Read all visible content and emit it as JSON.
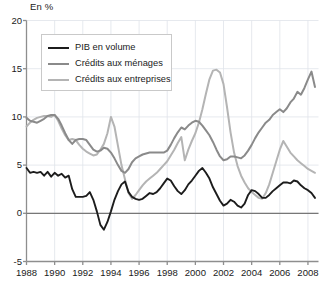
{
  "unit_label": "En %",
  "legend": {
    "items": [
      {
        "label": "PIB en volume",
        "color": "#1c1c1c"
      },
      {
        "label": "Crédits aux ménages",
        "color": "#8a8a8a"
      },
      {
        "label": "Crédits aux entreprises",
        "color": "#b4b4b4"
      }
    ]
  },
  "axis": {
    "y_ticks": [
      "20",
      "15",
      "10",
      "5",
      "0",
      "-5"
    ],
    "x_ticks": [
      "1988",
      "1990",
      "1992",
      "1994",
      "1996",
      "1998",
      "2000",
      "2002",
      "2004",
      "2006",
      "2008"
    ]
  },
  "chart_data": {
    "type": "line",
    "title": "",
    "xlabel": "",
    "ylabel": "En %",
    "xlim": [
      1988,
      2008.75
    ],
    "ylim": [
      -5,
      20
    ],
    "ytick_values": [
      20,
      15,
      10,
      5,
      0,
      -5
    ],
    "xtick_values": [
      1988,
      1990,
      1992,
      1994,
      1996,
      1998,
      2000,
      2002,
      2004,
      2006,
      2008
    ],
    "grid": true,
    "legend_position": "upper-left-inside",
    "zero_line": 0,
    "x": [
      1988,
      1988.25,
      1988.5,
      1988.75,
      1989,
      1989.25,
      1989.5,
      1989.75,
      1990,
      1990.25,
      1990.5,
      1990.75,
      1991,
      1991.25,
      1991.5,
      1991.75,
      1992,
      1992.25,
      1992.5,
      1992.75,
      1993,
      1993.25,
      1993.5,
      1993.75,
      1994,
      1994.25,
      1994.5,
      1994.75,
      1995,
      1995.25,
      1995.5,
      1995.75,
      1996,
      1996.25,
      1996.5,
      1996.75,
      1997,
      1997.25,
      1997.5,
      1997.75,
      1998,
      1998.25,
      1998.5,
      1998.75,
      1999,
      1999.25,
      1999.5,
      1999.75,
      2000,
      2000.25,
      2000.5,
      2000.75,
      2001,
      2001.25,
      2001.5,
      2001.75,
      2002,
      2002.25,
      2002.5,
      2002.75,
      2003,
      2003.25,
      2003.5,
      2003.75,
      2004,
      2004.25,
      2004.5,
      2004.75,
      2005,
      2005.25,
      2005.5,
      2005.75,
      2006,
      2006.25,
      2006.5,
      2006.75,
      2007,
      2007.25,
      2007.5,
      2007.75,
      2008,
      2008.25,
      2008.5
    ],
    "series": [
      {
        "name": "PIB en volume",
        "color": "#1c1c1c",
        "values": [
          4.7,
          4.2,
          4.3,
          4.2,
          4.3,
          3.9,
          4.3,
          3.8,
          4.2,
          3.9,
          4.1,
          3.7,
          3.9,
          2.5,
          1.7,
          1.7,
          1.7,
          1.8,
          2.2,
          1.4,
          0.2,
          -1.2,
          -1.7,
          -0.9,
          0.2,
          1.4,
          2.3,
          3.0,
          3.3,
          2.2,
          1.7,
          1.5,
          1.4,
          1.5,
          1.8,
          2.1,
          2.0,
          2.2,
          2.6,
          3.1,
          3.6,
          3.4,
          2.8,
          2.3,
          2.0,
          2.4,
          3.0,
          3.4,
          3.9,
          4.4,
          4.7,
          4.2,
          3.6,
          2.7,
          2.0,
          1.3,
          0.8,
          1.0,
          1.4,
          1.2,
          0.8,
          0.6,
          1.0,
          1.9,
          2.4,
          2.3,
          2.0,
          1.6,
          1.6,
          1.9,
          2.3,
          2.6,
          2.9,
          3.2,
          3.2,
          3.1,
          3.4,
          3.3,
          2.9,
          2.6,
          2.4,
          2.1,
          1.6
        ]
      },
      {
        "name": "Crédits aux ménages",
        "color": "#8a8a8a",
        "values": [
          9.9,
          9.6,
          9.5,
          9.4,
          9.6,
          9.8,
          10.1,
          10.2,
          10.2,
          9.8,
          9.1,
          8.3,
          7.6,
          7.2,
          7.6,
          7.7,
          7.7,
          7.6,
          7.1,
          6.6,
          6.4,
          6.5,
          6.8,
          6.7,
          6.3,
          5.7,
          5.0,
          4.4,
          4.2,
          4.6,
          5.3,
          5.7,
          5.9,
          6.1,
          6.2,
          6.3,
          6.3,
          6.3,
          6.3,
          6.3,
          6.5,
          7.1,
          7.8,
          8.4,
          8.9,
          8.7,
          9.1,
          9.4,
          9.6,
          9.5,
          9.1,
          8.6,
          8.1,
          7.4,
          6.6,
          5.9,
          5.5,
          5.6,
          5.9,
          5.9,
          5.8,
          5.7,
          6.0,
          6.5,
          7.1,
          7.8,
          8.4,
          8.9,
          9.4,
          9.7,
          10.2,
          10.5,
          10.8,
          10.5,
          10.9,
          11.5,
          11.9,
          12.6,
          12.3,
          13.0,
          13.9,
          14.7,
          13.1
        ]
      },
      {
        "name": "Crédits aux entreprises",
        "color": "#b4b4b4",
        "values": [
          9.0,
          9.4,
          9.7,
          9.9,
          10.0,
          10.1,
          10.1,
          10.0,
          10.2,
          9.6,
          8.8,
          8.1,
          7.6,
          7.7,
          7.6,
          7.1,
          6.7,
          6.4,
          6.2,
          6.0,
          6.1,
          6.6,
          7.2,
          8.3,
          10.0,
          9.0,
          7.0,
          5.0,
          3.5,
          2.1,
          1.5,
          1.9,
          2.4,
          2.9,
          3.3,
          3.6,
          3.9,
          4.2,
          4.6,
          5.0,
          5.4,
          6.0,
          6.6,
          7.3,
          7.9,
          5.5,
          6.6,
          7.5,
          8.3,
          9.4,
          10.8,
          12.4,
          13.9,
          14.8,
          14.9,
          14.6,
          13.4,
          11.0,
          8.4,
          6.3,
          4.9,
          3.9,
          3.2,
          2.6,
          2.2,
          1.9,
          1.6,
          1.5,
          2.1,
          3.0,
          4.2,
          5.4,
          6.6,
          7.5,
          6.9,
          6.3,
          5.9,
          5.5,
          5.2,
          4.9,
          4.6,
          4.4,
          4.2
        ]
      }
    ]
  }
}
